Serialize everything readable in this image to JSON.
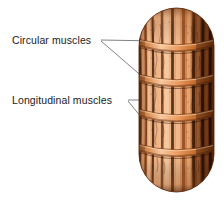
{
  "figure": {
    "type": "biology-anatomy-diagram",
    "background_color": "#ffffff"
  },
  "labels": [
    {
      "id": "circular",
      "text": "Circular muscles",
      "x": 12,
      "y": 35,
      "color": "#1a1a1a"
    },
    {
      "id": "longitudinal",
      "text": "Longitudinal muscles",
      "x": 12,
      "y": 95,
      "color": "#1a1a1a"
    }
  ],
  "leader_lines": {
    "color": "#4a4a4a",
    "width": 0.7,
    "circular": [
      {
        "x1": 101,
        "y1": 40,
        "x2": 158,
        "y2": 41
      },
      {
        "x1": 101,
        "y1": 41,
        "x2": 152,
        "y2": 84
      }
    ],
    "longitudinal": [
      {
        "x1": 128,
        "y1": 100,
        "x2": 176,
        "y2": 100
      },
      {
        "x1": 128,
        "y1": 101,
        "x2": 150,
        "y2": 127
      }
    ]
  },
  "worm": {
    "outline_color": "#7a3a12",
    "body_fill": "#e09a6a",
    "body_fill_light": "#f0b98e",
    "body_fill_dark": "#b5612c",
    "shadow_color": "#3a1c08",
    "band_color": "#e2894a",
    "band_highlight": "#f6c49a",
    "bounds": {
      "left": 139,
      "top": 8,
      "right": 214,
      "bottom": 192
    },
    "circular_band_y": [
      43,
      78,
      113,
      148
    ],
    "longitudinal_stripe_count": 13,
    "segments": 5
  }
}
